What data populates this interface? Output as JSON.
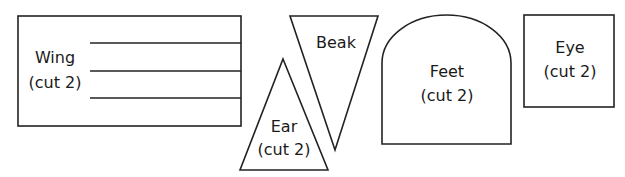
{
  "pieces": [
    {
      "name": "Wing",
      "label": "Wing",
      "note": "(cut 2)"
    },
    {
      "name": "Beak",
      "label": "Beak",
      "note": ""
    },
    {
      "name": "Ear",
      "label": "Ear",
      "note": "(cut 2)"
    },
    {
      "name": "Feet",
      "label": "Feet",
      "note": "(cut 2)"
    },
    {
      "name": "Eye",
      "label": "Eye",
      "note": "(cut 2)"
    }
  ],
  "colors": {
    "stroke": "#222222",
    "fill": "#ffffff",
    "text": "#1a1a1a"
  }
}
